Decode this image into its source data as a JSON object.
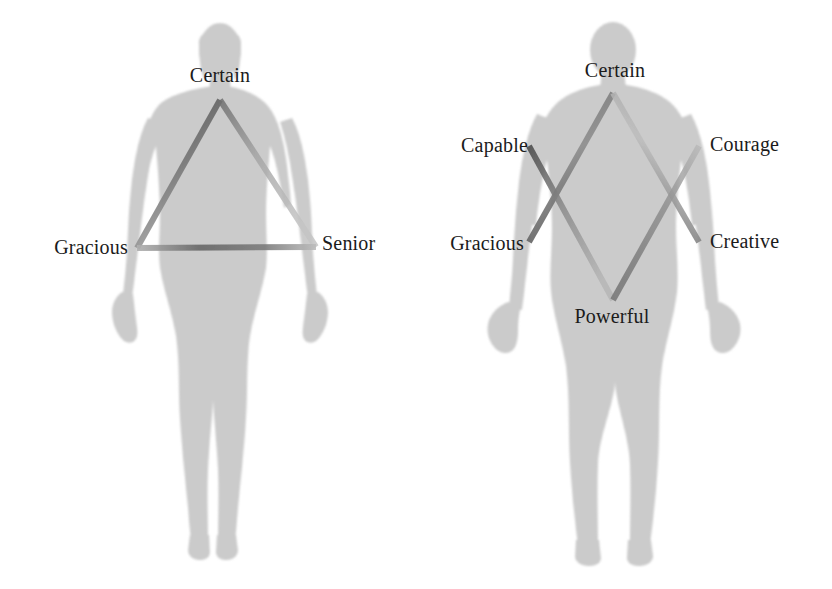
{
  "figures": [
    {
      "id": "female-figure",
      "shape": "triangle",
      "silhouette": "female-body-silhouette",
      "labels": [
        {
          "name": "label-certain",
          "text": "Certain",
          "x": 220,
          "y": 75,
          "align": "mid"
        },
        {
          "name": "label-gracious",
          "text": "Gracious",
          "x": 128,
          "y": 247,
          "align": "left"
        },
        {
          "name": "label-senior",
          "text": "Senior",
          "x": 322,
          "y": 243,
          "align": "right"
        }
      ]
    },
    {
      "id": "male-figure",
      "shape": "hexagram",
      "silhouette": "male-body-silhouette",
      "labels": [
        {
          "name": "label-certain",
          "text": "Certain",
          "x": 615,
          "y": 70,
          "align": "mid"
        },
        {
          "name": "label-capable",
          "text": "Capable",
          "x": 528,
          "y": 145,
          "align": "left"
        },
        {
          "name": "label-courage",
          "text": "Courage",
          "x": 710,
          "y": 144,
          "align": "right"
        },
        {
          "name": "label-gracious",
          "text": "Gracious",
          "x": 524,
          "y": 243,
          "align": "left"
        },
        {
          "name": "label-creative",
          "text": "Creative",
          "x": 710,
          "y": 241,
          "align": "right"
        },
        {
          "name": "label-powerful",
          "text": "Powerful",
          "x": 612,
          "y": 316,
          "align": "mid"
        }
      ]
    }
  ],
  "colors": {
    "background": "#ffffff",
    "silhouette": "#c9c9c9",
    "silhouette_shade": "#bdbdbd",
    "line_dark": "#5a5a5a",
    "line_mid": "#8d8d8d",
    "line_light": "#b9b9b9",
    "text": "#1b1b1b"
  },
  "geometry": {
    "female_triangle": {
      "apex": {
        "x": 220,
        "y": 100
      },
      "base_left": {
        "x": 137,
        "y": 248
      },
      "base_right": {
        "x": 316,
        "y": 247
      }
    },
    "male_hexagram": {
      "up_triangle": [
        {
          "x": 613,
          "y": 93
        },
        {
          "x": 529,
          "y": 242
        },
        {
          "x": 699,
          "y": 242
        }
      ],
      "down_triangle": [
        {
          "x": 613,
          "y": 300
        },
        {
          "x": 529,
          "y": 146
        },
        {
          "x": 699,
          "y": 146
        }
      ]
    }
  }
}
